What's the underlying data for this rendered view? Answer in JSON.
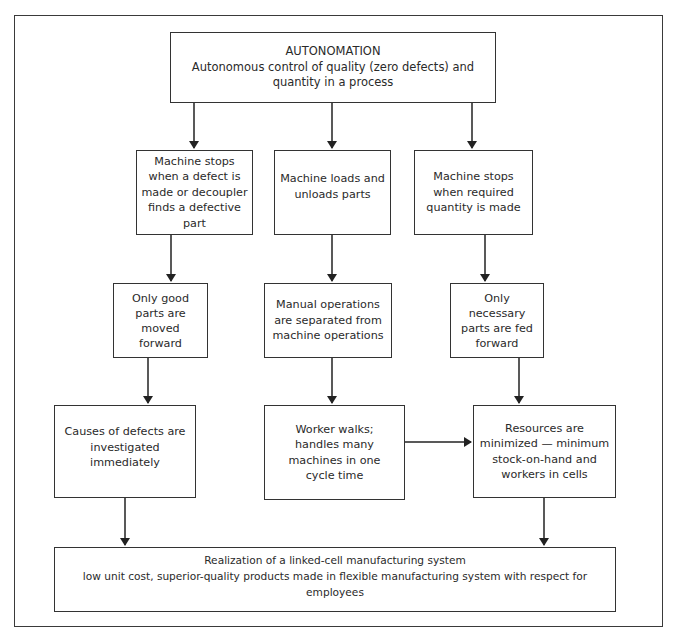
{
  "diagram": {
    "title": "AUTONOMATION",
    "top": {
      "title": "AUTONOMATION",
      "lines": [
        "Autonomous control of quality (zero defects) and",
        "quantity in a process"
      ]
    },
    "left_column": [
      {
        "lines": [
          "Machine stops",
          "when a defect is",
          "made or decoupler",
          "finds a defective part"
        ]
      },
      {
        "lines": [
          "Only good",
          "parts are",
          "moved",
          "forward"
        ]
      },
      {
        "lines": [
          "Causes of defects are",
          "investigated",
          "immediately"
        ]
      }
    ],
    "middle_column": [
      {
        "lines": [
          "Machine loads and",
          "unloads parts"
        ]
      },
      {
        "lines": [
          "Manual operations",
          "are separated from",
          "machine operations"
        ]
      },
      {
        "lines": [
          "Worker walks;",
          "handles many",
          "machines in one",
          "cycle time"
        ]
      }
    ],
    "right_column": [
      {
        "lines": [
          "Machine stops",
          "when required",
          "quantity is made"
        ]
      },
      {
        "lines": [
          "Only",
          "necessary",
          "parts are fed",
          "forward"
        ]
      },
      {
        "lines": [
          "Resources are",
          "minimized — minimum",
          "stock-on-hand and",
          "workers in cells"
        ]
      }
    ],
    "bottom": {
      "lines": [
        "Realization of a linked-cell manufacturing system",
        "low unit cost, superior-quality products made in flexible manufacturing system with respect for employees"
      ]
    },
    "edges": [
      {
        "from": "top",
        "to": "left_column.0"
      },
      {
        "from": "top",
        "to": "middle_column.0"
      },
      {
        "from": "top",
        "to": "right_column.0"
      },
      {
        "from": "left_column.0",
        "to": "left_column.1"
      },
      {
        "from": "left_column.1",
        "to": "left_column.2"
      },
      {
        "from": "left_column.2",
        "to": "bottom"
      },
      {
        "from": "middle_column.0",
        "to": "middle_column.1"
      },
      {
        "from": "middle_column.1",
        "to": "middle_column.2"
      },
      {
        "from": "middle_column.2",
        "to": "right_column.2"
      },
      {
        "from": "right_column.0",
        "to": "right_column.1"
      },
      {
        "from": "right_column.1",
        "to": "right_column.2"
      },
      {
        "from": "right_column.2",
        "to": "bottom"
      }
    ]
  }
}
